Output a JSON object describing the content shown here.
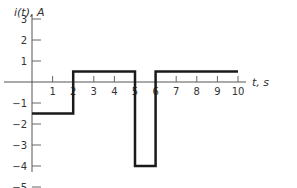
{
  "chart_data": {
    "type": "line",
    "title": "",
    "xlabel": "t, s",
    "ylabel": "i(t), A",
    "xlim": [
      0,
      10.5
    ],
    "ylim": [
      -5,
      3
    ],
    "grid": false,
    "x_ticks": [
      1,
      2,
      3,
      4,
      5,
      6,
      7,
      8,
      9,
      10
    ],
    "y_ticks": [
      3,
      2,
      1,
      -1,
      -2,
      -3,
      -4,
      -5
    ],
    "series": [
      {
        "name": "i(t)",
        "style": "step",
        "segments": [
          {
            "t_start": 0,
            "t_end": 2,
            "value": -1.5
          },
          {
            "t_start": 2,
            "t_end": 5,
            "value": 0.5
          },
          {
            "t_start": 5,
            "t_end": 6,
            "value": -4
          },
          {
            "t_start": 6,
            "t_end": 10,
            "value": 0.5
          }
        ]
      }
    ]
  },
  "labels": {
    "ylabel": "i(t), A",
    "xlabel": "t, s"
  }
}
